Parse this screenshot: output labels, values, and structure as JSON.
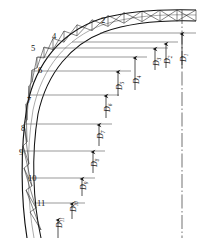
{
  "figure": {
    "type": "engineering-line-drawing",
    "background_color": "#ffffff",
    "line_color": "#1a1a1a",
    "thin_line_color": "#555555"
  },
  "node_labels": [
    {
      "id": "node-2",
      "text": "2",
      "x": 101,
      "y": 23
    },
    {
      "id": "node-4",
      "text": "4",
      "x": 52,
      "y": 39
    },
    {
      "id": "node-5",
      "text": "5",
      "x": 31,
      "y": 51
    },
    {
      "id": "node-6",
      "text": "6",
      "x": 38,
      "y": 73
    },
    {
      "id": "node-7",
      "text": "7",
      "x": 27,
      "y": 103
    },
    {
      "id": "node-8",
      "text": "8",
      "x": 21,
      "y": 131
    },
    {
      "id": "node-9",
      "text": "9",
      "x": 19,
      "y": 155
    },
    {
      "id": "node-10",
      "text": "10",
      "x": 28,
      "y": 181
    },
    {
      "id": "node-11",
      "text": "11",
      "x": 37,
      "y": 206
    }
  ],
  "dimension_labels": [
    {
      "id": "dim-D1",
      "base": "D",
      "sub": "1",
      "x": 186,
      "y": 62
    },
    {
      "id": "dim-D2",
      "base": "D",
      "sub": "2",
      "x": 170,
      "y": 64
    },
    {
      "id": "dim-D3",
      "base": "D",
      "sub": "3",
      "x": 159,
      "y": 66
    },
    {
      "id": "dim-D4",
      "base": "D",
      "sub": "4",
      "x": 139,
      "y": 84
    },
    {
      "id": "dim-D5",
      "base": "D",
      "sub": "5",
      "x": 122,
      "y": 90
    },
    {
      "id": "dim-D6",
      "base": "D",
      "sub": "6",
      "x": 110,
      "y": 112
    },
    {
      "id": "dim-D7",
      "base": "D",
      "sub": "7",
      "x": 103,
      "y": 139
    },
    {
      "id": "dim-D8",
      "base": "D",
      "sub": "8",
      "x": 97,
      "y": 167
    },
    {
      "id": "dim-D9",
      "base": "D",
      "sub": "9",
      "x": 86,
      "y": 190
    },
    {
      "id": "dim-D10",
      "base": "D",
      "sub": "10",
      "x": 76,
      "y": 212
    },
    {
      "id": "dim-D11",
      "base": "D",
      "sub": "11",
      "x": 62,
      "y": 228
    }
  ],
  "step_lines": [
    {
      "id": "step-1",
      "y": 33,
      "x_left": 100,
      "x_right": 196
    },
    {
      "id": "step-2",
      "y": 42,
      "x_left": 72,
      "x_right": 178
    },
    {
      "id": "step-3",
      "y": 48,
      "x_left": 45,
      "x_right": 168
    },
    {
      "id": "step-4",
      "y": 57,
      "x_left": 38,
      "x_right": 147
    },
    {
      "id": "step-5",
      "y": 71,
      "x_left": 33,
      "x_right": 131
    },
    {
      "id": "step-6",
      "y": 95,
      "x_left": 30,
      "x_right": 119
    },
    {
      "id": "step-7",
      "y": 124,
      "x_left": 24,
      "x_right": 112
    },
    {
      "id": "step-8",
      "y": 151,
      "x_left": 20,
      "x_right": 105
    },
    {
      "id": "step-9",
      "y": 178,
      "x_left": 27,
      "x_right": 95
    },
    {
      "id": "step-10",
      "y": 203,
      "x_left": 36,
      "x_right": 85
    }
  ],
  "center_line": {
    "id": "vertical-centerline",
    "x": 182,
    "y_top": 10,
    "y_bottom": 238,
    "style": "dash-dot"
  },
  "arrows": [
    {
      "id": "arrow-D1",
      "x": 182,
      "y_tail": 68,
      "y_head": 34
    },
    {
      "id": "arrow-D2",
      "x": 166,
      "y_tail": 68,
      "y_head": 44
    },
    {
      "id": "arrow-D3",
      "x": 155,
      "y_tail": 70,
      "y_head": 49
    },
    {
      "id": "arrow-D4",
      "x": 135,
      "y_tail": 90,
      "y_head": 58
    },
    {
      "id": "arrow-D5",
      "x": 118,
      "y_tail": 96,
      "y_head": 72
    },
    {
      "id": "arrow-D6",
      "x": 106,
      "y_tail": 118,
      "y_head": 96
    },
    {
      "id": "arrow-D7",
      "x": 99,
      "y_tail": 146,
      "y_head": 125
    },
    {
      "id": "arrow-D8",
      "x": 93,
      "y_tail": 173,
      "y_head": 152
    },
    {
      "id": "arrow-D9",
      "x": 82,
      "y_tail": 196,
      "y_head": 179
    },
    {
      "id": "arrow-D10",
      "x": 72,
      "y_tail": 219,
      "y_head": 204
    },
    {
      "id": "arrow-D11",
      "x": 58,
      "y_tail": 238,
      "y_head": 220
    }
  ]
}
